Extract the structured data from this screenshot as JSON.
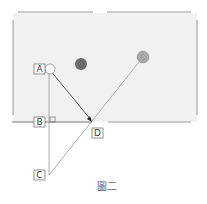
{
  "figure": {
    "caption": "圖二",
    "colors": {
      "table_fill": "#f1f1f1",
      "rail": "#9a9a9a",
      "line": "#777777",
      "dark_ball": "#6a6a6a",
      "gray_ball": "#a8a8a8",
      "cue_ball": "#ffffff"
    }
  },
  "labels": {
    "a": "A",
    "b": "B",
    "c": "C",
    "d": "D"
  },
  "balls": [
    {
      "name": "cue-ball",
      "color": "white"
    },
    {
      "name": "dark-ball",
      "color": "dark gray"
    },
    {
      "name": "target-ball",
      "color": "gray"
    }
  ]
}
